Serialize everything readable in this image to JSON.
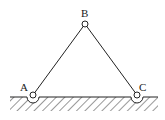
{
  "diagram": {
    "type": "truss",
    "nodes": [
      {
        "id": "A",
        "label": "A",
        "x": 33,
        "y": 95,
        "support": "pin"
      },
      {
        "id": "B",
        "label": "B",
        "x": 85,
        "y": 24,
        "support": "none"
      },
      {
        "id": "C",
        "label": "C",
        "x": 137,
        "y": 95,
        "support": "pin"
      }
    ],
    "members": [
      {
        "from": "A",
        "to": "B"
      },
      {
        "from": "B",
        "to": "C"
      }
    ],
    "ground": {
      "label": "",
      "hatched": true
    }
  },
  "labels": {
    "a": "A",
    "b": "B",
    "c": "C"
  }
}
